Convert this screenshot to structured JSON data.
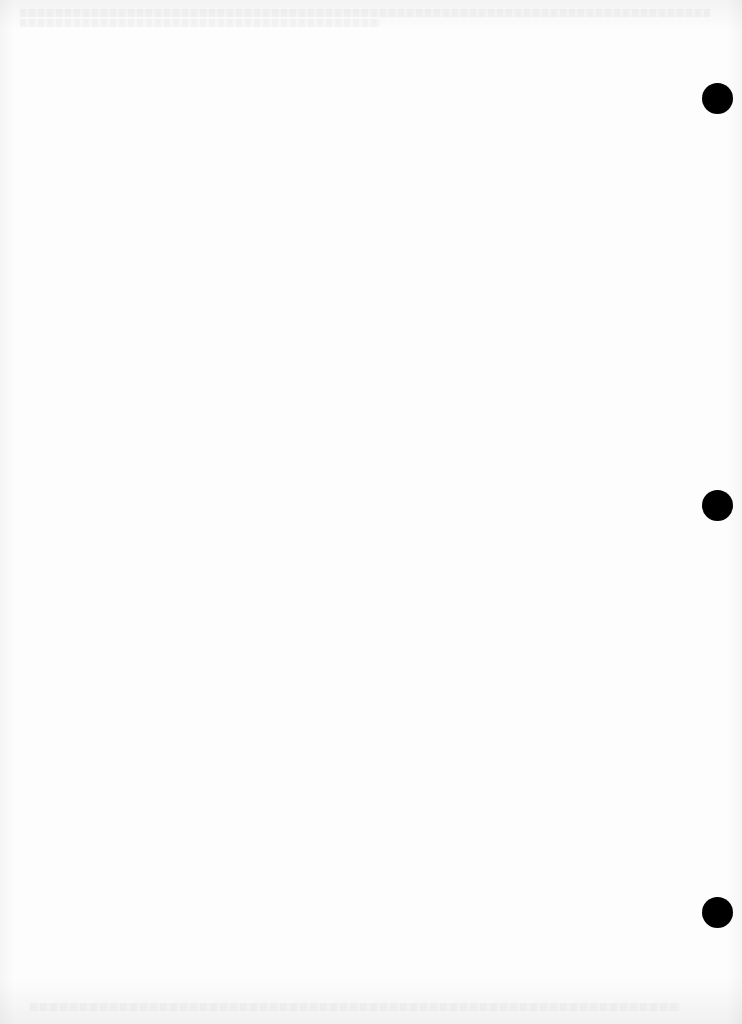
{
  "document": {
    "type": "blank scanned page",
    "background_color": "#fdfdfd",
    "hole_color": "#000000",
    "punch_holes": [
      {
        "name": "top",
        "cx": 717,
        "cy": 98
      },
      {
        "name": "middle",
        "cx": 717,
        "cy": 505
      },
      {
        "name": "bottom",
        "cx": 717,
        "cy": 912
      }
    ],
    "hole_diameter": 31
  }
}
